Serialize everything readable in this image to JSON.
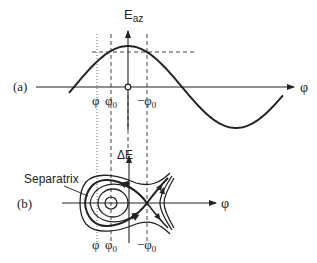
{
  "panel_a": {
    "label": "(a)",
    "y_axis_label_main": "E",
    "y_axis_label_sub": "az",
    "x_axis_label": "φ",
    "tick_phi": "φ",
    "tick_phi0_main": "φ",
    "tick_phi0_sub": "0",
    "tick_neg_phi0_main": "−φ",
    "tick_neg_phi0_sub": "0"
  },
  "panel_b": {
    "label": "(b)",
    "y_axis_label": "ΔE",
    "x_axis_label": "φ",
    "separatrix_label": "Separatrix",
    "tick_phi": "φ",
    "tick_phi0_main": "φ",
    "tick_phi0_sub": "0",
    "tick_neg_phi0_main": "−φ",
    "tick_neg_phi0_sub": "0"
  },
  "colors": {
    "ink": "#222222",
    "guide": "#555555"
  }
}
